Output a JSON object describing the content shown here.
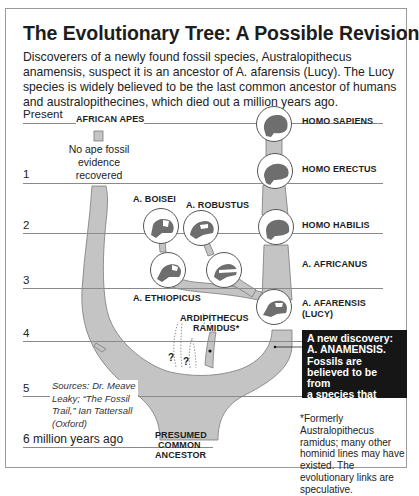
{
  "title": "The Evolutionary Tree: A Possible Revision",
  "intro": "Discoverers of a newly found fossil species, Australopithecus anamensis, suspect it is an ancestor of A. afarensis (Lucy). The Lucy species is widely believed to be the last common ancestor of humans and australopithecines, which died out a million years ago.",
  "timeline": {
    "labels": [
      "Present",
      "1",
      "2",
      "3",
      "4",
      "5",
      "6 million years ago"
    ]
  },
  "species": {
    "african_apes": "AFRICAN APES",
    "homo_sapiens": "HOMO SAPIENS",
    "homo_erectus": "HOMO ERECTUS",
    "homo_habilis": "HOMO HABILIS",
    "a_boisei": "A. BOISEI",
    "a_robustus": "A. ROBUSTUS",
    "a_ethiopicus": "A. ETHIOPICUS",
    "a_africanus": "A. AFRICANUS",
    "a_afarensis": "A. AFARENSIS",
    "a_afarensis_alias": "(LUCY)",
    "ardipithecus_line1": "ARDIPITHECUS",
    "ardipithecus_line2": "RAMIDUS*",
    "common_ancestor_line1": "PRESUMED",
    "common_ancestor_line2": "COMMON",
    "common_ancestor_line3": "ANCESTOR"
  },
  "ape_note": {
    "line1": "No ape fossil",
    "line2": "evidence",
    "line3": "recovered"
  },
  "unknown_marks": [
    "?",
    "?"
  ],
  "sources": {
    "line1": "Sources: Dr. Meave",
    "line2": "Leaky; “The Fossil",
    "line3": "Trail,” Ian Tattersall",
    "line4": "(Oxford)"
  },
  "callout": {
    "line1": "A new discovery:",
    "line2": "A. ANAMENSIS.",
    "line3": "Fossils are",
    "line4": "believed to be from",
    "line5": "a species that",
    "line6": "walked on two feet."
  },
  "footnote": "*Formerly Australopithecus ramidus; many other hominid lines may have existed. The evolutionary links are speculative.",
  "colors": {
    "branch_fill": "#c4c4c4",
    "branch_stroke": "#7a7a7a",
    "skull_fill": "#6e6e6e",
    "callout_bg": "#161616",
    "timeline_line": "#8a8a8a"
  }
}
